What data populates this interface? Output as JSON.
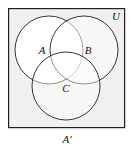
{
  "figure": {
    "name": "venn-diagram-three-sets",
    "type": "venn",
    "sets": [
      "A",
      "B",
      "C"
    ],
    "universe_label": "U",
    "caption": "A'",
    "colors": {
      "universe_fill": "#f0f0ef",
      "circle_fill": "#ffffff",
      "stroke": "#231f20",
      "page_background": "#ffffff",
      "label_color": "#111111"
    },
    "rectangle": {
      "x": 8,
      "y": 8,
      "width": 117,
      "height": 120,
      "stroke_width": 1.2
    },
    "circles": [
      {
        "id": "circle-a",
        "label": "A",
        "cx": 49,
        "cy": 50,
        "r": 34
      },
      {
        "id": "circle-b",
        "label": "B",
        "cx": 84,
        "cy": 50,
        "r": 34
      },
      {
        "id": "circle-c",
        "label": "C",
        "cx": 66,
        "cy": 86,
        "r": 34
      }
    ],
    "labels": {
      "a": "A",
      "b": "B",
      "c": "C",
      "universe": "U",
      "complement": "A'"
    }
  }
}
